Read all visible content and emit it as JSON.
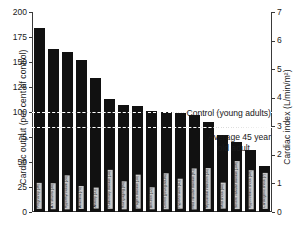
{
  "chart_data": {
    "type": "bar",
    "title": "",
    "xlabel": "",
    "ylabel": "Cardiac output (per cent of control)",
    "y2label": "Cardiac index (L/min/m²)",
    "ylim": [
      0,
      200
    ],
    "y2lim": [
      0,
      7
    ],
    "grid": false,
    "legend": "none",
    "yticks": [
      "0",
      "25",
      "50",
      "75",
      "100",
      "125",
      "150",
      "175",
      "200"
    ],
    "y2ticks": [
      "0",
      "1",
      "2",
      "3",
      "4",
      "5",
      "6",
      "7"
    ],
    "categories": [
      "Pregnancy (36)",
      "A-V shunts (30)",
      "Hyperthyroidism (20)",
      "Anaemia (70)",
      "Anxiety (31)",
      "Pulmonary disease (10)",
      "Rising aging (80)",
      "Paget's disease (10)",
      "Beri-beri (12)",
      "Control (young adults)",
      "Hypertension (41)",
      "Mild valvular disease (61)",
      "Myocardial infarction (35)",
      "Mild shock (40)",
      "Severe valvular disease (106)",
      "Hypovolemic shock (48)",
      "Cardiogenic shock (7)"
    ],
    "values": [
      184,
      163,
      160,
      152,
      134,
      113,
      107,
      106,
      101,
      100,
      99,
      97,
      90,
      77,
      70,
      62,
      46
    ],
    "annotations": [
      {
        "text": "Control (young adults)",
        "value": 100
      },
      {
        "text": "Average 45 year",
        "value": 85
      },
      {
        "text": "old adult",
        "value": 85
      }
    ],
    "reference_lines": [
      {
        "label": "Control (young adults)",
        "value": 100,
        "style": "dashed"
      },
      {
        "label": "Average 45 year old adult",
        "value": 85,
        "style": "dashed"
      }
    ]
  }
}
